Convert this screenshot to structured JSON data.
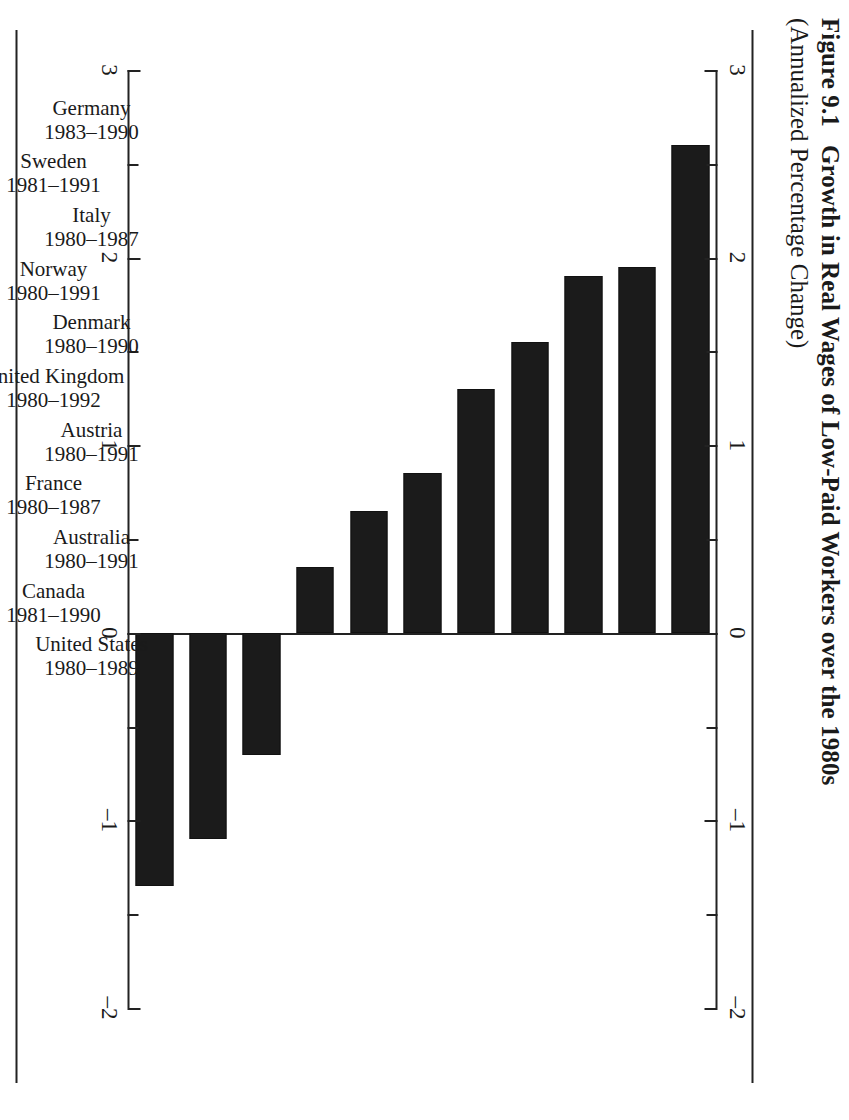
{
  "figure": {
    "number": "Figure 9.1",
    "title": "Growth in Real Wages of Low-Paid Workers over the 1980s",
    "subtitle": "(Annualized Percentage Change)"
  },
  "axis": {
    "ticks_major": [
      "3",
      "2",
      "1",
      "0",
      "-1",
      "-2"
    ],
    "tick_values": [
      3,
      2,
      1,
      0,
      -1,
      -2
    ],
    "minor_step": 0.5,
    "min": -2,
    "max": 3
  },
  "chart_data": {
    "type": "bar",
    "orientation": "horizontal",
    "title": "Growth in Real Wages of Low-Paid Workers over the 1980s",
    "subtitle": "(Annualized Percentage Change)",
    "xlabel": "",
    "ylabel": "",
    "xlim": [
      -2,
      3
    ],
    "grid": false,
    "legend": null,
    "categories": [
      "Germany",
      "Sweden",
      "Italy",
      "Norway",
      "Denmark",
      "United Kingdom",
      "Austria",
      "France",
      "Australia",
      "Canada",
      "United States"
    ],
    "period_labels": [
      "1983–1990",
      "1981–1991",
      "1980–1987",
      "1980–1991",
      "1980–1990",
      "1980–1992",
      "1980–1991",
      "1980–1987",
      "1980–1991",
      "1981–1990",
      "1980–1989"
    ],
    "values": [
      2.6,
      1.95,
      1.9,
      1.55,
      1.3,
      0.85,
      0.65,
      0.35,
      -0.65,
      -1.1,
      -1.35
    ],
    "bar_color": "#1b1b1b"
  },
  "bars": [
    {
      "country": "Germany",
      "period": "1983–1990",
      "value": 2.6
    },
    {
      "country": "Sweden",
      "period": "1981–1991",
      "value": 1.95
    },
    {
      "country": "Italy",
      "period": "1980–1987",
      "value": 1.9
    },
    {
      "country": "Norway",
      "period": "1980–1991",
      "value": 1.55
    },
    {
      "country": "Denmark",
      "period": "1980–1990",
      "value": 1.3
    },
    {
      "country": "United Kingdom",
      "period": "1980–1992",
      "value": 0.85
    },
    {
      "country": "Austria",
      "period": "1980–1991",
      "value": 0.65
    },
    {
      "country": "France",
      "period": "1980–1987",
      "value": 0.35
    },
    {
      "country": "Australia",
      "period": "1980–1991",
      "value": -0.65
    },
    {
      "country": "Canada",
      "period": "1981–1990",
      "value": -1.1
    },
    {
      "country": "United States",
      "period": "1980–1989",
      "value": -1.35
    }
  ]
}
